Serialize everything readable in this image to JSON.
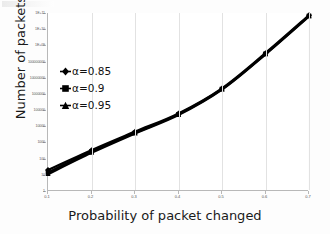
{
  "chart_data": {
    "type": "line",
    "title": "",
    "xlabel": "Probability of  packet  changed",
    "ylabel": "Number of packets",
    "x": [
      0.1,
      0.2,
      0.3,
      0.4,
      0.5,
      0.6,
      0.7
    ],
    "xticklabels": [
      "0.1",
      "0.2",
      "0.3",
      "0.4",
      "0.5",
      "0.6",
      "0.7"
    ],
    "yticklabels": [
      "1E+11",
      "1E+10",
      "1E+09",
      "100000000",
      "10000000",
      "1000000",
      "100000",
      "10000",
      "1000",
      "100",
      "10",
      "1"
    ],
    "ytickvalues": [
      100000000000.0,
      10000000000.0,
      1000000000.0,
      100000000.0,
      10000000.0,
      1000000.0,
      100000.0,
      10000.0,
      1000.0,
      100,
      10,
      1
    ],
    "yscale": "log",
    "ylim": [
      1,
      100000000000
    ],
    "xlim": [
      0.1,
      0.7
    ],
    "grid": "vertical-only",
    "legend_position": "inside-upper-left",
    "series": [
      {
        "name": "α=0.85",
        "marker": "diamond",
        "color": "#000000",
        "values": [
          20,
          330,
          4600,
          62000,
          2200000,
          330000000,
          72000000000
        ]
      },
      {
        "name": "α=0.9",
        "marker": "square",
        "color": "#000000",
        "values": [
          14,
          270,
          4000,
          55000,
          2000000,
          300000000,
          66000000000
        ]
      },
      {
        "name": "α=0.95",
        "marker": "triangle",
        "color": "#000000",
        "values": [
          11,
          230,
          3600,
          50000,
          1850000,
          280000000,
          62000000000
        ]
      }
    ]
  },
  "legend": {
    "items": [
      {
        "label": "α=0.85",
        "marker": "diamond"
      },
      {
        "label": "α=0.9",
        "marker": "square"
      },
      {
        "label": "α=0.95",
        "marker": "triangle"
      }
    ]
  },
  "axes": {
    "x_title": "Probability of  packet  changed",
    "y_title": "Number of packets"
  }
}
